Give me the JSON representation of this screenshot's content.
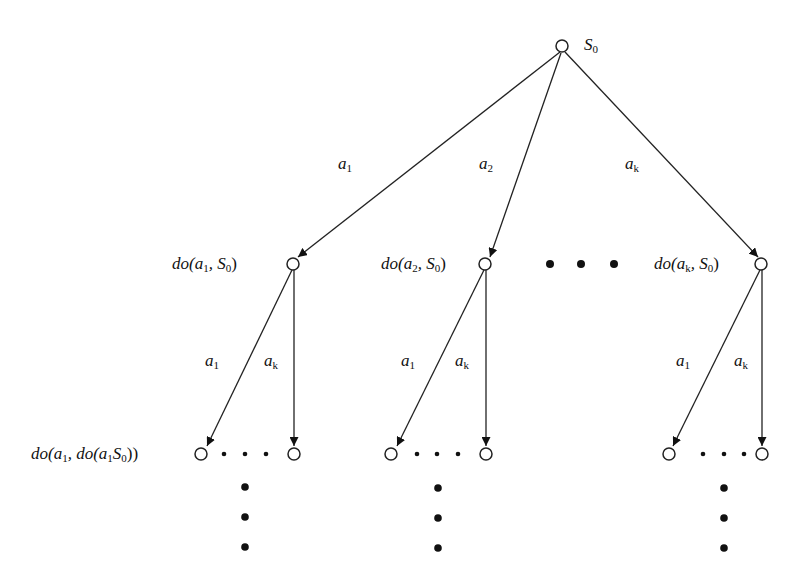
{
  "diagram": {
    "root": {
      "label": "S",
      "sub": "0"
    },
    "level1": [
      {
        "id": "n1",
        "label_prefix": "do(a",
        "label_sub": "1",
        "label_mid": ", S",
        "label_sub2": "0",
        "label_suffix": ")"
      },
      {
        "id": "n2",
        "label_prefix": "do(a",
        "label_sub": "2",
        "label_mid": ", S",
        "label_sub2": "0",
        "label_suffix": ")"
      },
      {
        "id": "nk",
        "label_prefix": "do(a",
        "label_sub": "k",
        "label_mid": ", S",
        "label_sub2": "0",
        "label_suffix": ")"
      }
    ],
    "level2_label": {
      "p1": "do(a",
      "s1": "1",
      "p2": ", do(a",
      "s2": "1",
      "p3": "S",
      "s3": "0",
      "p4": "))"
    },
    "edges_top": [
      {
        "label": "a",
        "sub": "1"
      },
      {
        "label": "a",
        "sub": "2"
      },
      {
        "label": "a",
        "sub": "k"
      }
    ],
    "edges_bottom": [
      {
        "left": {
          "label": "a",
          "sub": "1"
        },
        "right": {
          "label": "a",
          "sub": "k"
        }
      },
      {
        "left": {
          "label": "a",
          "sub": "1"
        },
        "right": {
          "label": "a",
          "sub": "k"
        }
      },
      {
        "left": {
          "label": "a",
          "sub": "1"
        },
        "right": {
          "label": "a",
          "sub": "k"
        }
      }
    ],
    "ellipsis_level1": "three horizontal dots",
    "ellipsis_level2": "three horizontal dots between leaves",
    "ellipsis_vertical": "three vertical dots below each subtree"
  }
}
